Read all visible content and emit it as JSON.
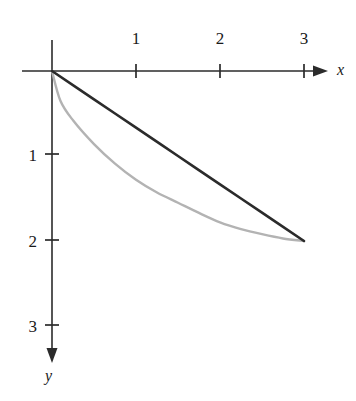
{
  "figure": {
    "background_color": "#ffffff",
    "axis_color": "#2b2b2b",
    "origin_px": {
      "x": 52,
      "y": 71
    },
    "unit_px": {
      "x": 84,
      "y": 85
    }
  },
  "axes": {
    "x_axis": {
      "label": "x",
      "label_px": {
        "x": 338,
        "y": 64
      },
      "arrow_tip_px": {
        "x": 328,
        "y": 71
      },
      "start_px": {
        "x": 22,
        "y": 71
      },
      "direction": "right",
      "tick_values": [
        1,
        2,
        3
      ],
      "tick_labels": [
        "1",
        "2",
        "3"
      ],
      "tick_px_x": [
        136,
        220,
        304
      ],
      "tick_label_y_px": 38,
      "tick_half_length_px": 7
    },
    "y_axis": {
      "label": "y",
      "label_px": {
        "x": 46,
        "y": 368
      },
      "arrow_tip_px": {
        "x": 52,
        "y": 362
      },
      "start_px": {
        "x": 52,
        "y": 40
      },
      "direction": "down",
      "tick_values": [
        1,
        2,
        3
      ],
      "tick_labels": [
        "1",
        "2",
        "3"
      ],
      "tick_px_y": [
        154,
        240,
        325
      ],
      "tick_label_x_px": 26,
      "tick_half_length_px": 7
    }
  },
  "chart_data": {
    "type": "line",
    "title": "",
    "subtitle": "",
    "xlabel": "x",
    "ylabel": "y",
    "xlim": [
      0,
      3.25
    ],
    "ylim": [
      0,
      3.4
    ],
    "y_axis_direction": "downward",
    "grid": false,
    "legend": "none",
    "xticks": [
      1,
      2,
      3
    ],
    "yticks": [
      1,
      2,
      3
    ],
    "annotations": [],
    "series": [
      {
        "name": "straight-line-chord",
        "color": "#2b2b2b",
        "width_px": 2.6,
        "description": "straight segment from origin (0,0) to (3,2)",
        "x": [
          0,
          0.5,
          1,
          1.5,
          2,
          2.5,
          3
        ],
        "y": [
          0,
          0.333,
          0.667,
          1.0,
          1.333,
          1.667,
          2.0
        ]
      },
      {
        "name": "concave-curve",
        "color": "#b3b3b3",
        "width_px": 2.4,
        "description": "concave curve sagging below the chord, from origin (0,0) to (3,2)",
        "x": [
          0,
          0.1,
          0.25,
          0.5,
          0.75,
          1.0,
          1.25,
          1.5,
          1.75,
          2.0,
          2.25,
          2.5,
          2.75,
          3.0
        ],
        "y": [
          0,
          0.35,
          0.58,
          0.86,
          1.09,
          1.28,
          1.43,
          1.55,
          1.67,
          1.78,
          1.86,
          1.92,
          1.97,
          2.0
        ]
      }
    ]
  }
}
